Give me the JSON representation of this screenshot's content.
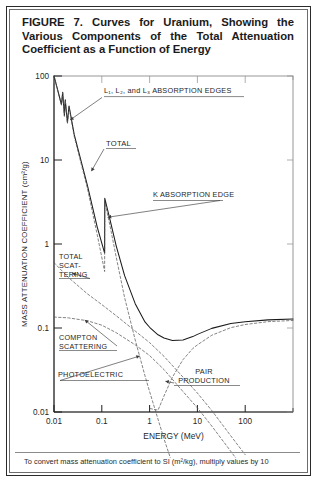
{
  "figure": {
    "caption": "FIGURE 7. Curves for Uranium, Showing the Various Components of the Total Attenuation Coefficient as a Function of Energy",
    "footnote": "To convert mass attenuation coefficient to SI (m²/kg), multiply values by 10"
  },
  "chart_data": {
    "type": "line",
    "title": "Curves for Uranium, Showing the Various Components of the Total Attenuation Coefficient as a Function of Energy",
    "xlabel": "ENERGY (MeV)",
    "ylabel": "MASS ATTENUATION COEFFICIENT (cm²/g)",
    "xscale": "log",
    "yscale": "log",
    "xlim": [
      0.01,
      1000
    ],
    "ylim": [
      0.01,
      100
    ],
    "xticks": [
      0.01,
      0.1,
      1,
      10,
      100
    ],
    "xtick_labels": [
      "0.01",
      "0.1",
      "1",
      "10",
      "100"
    ],
    "yticks": [
      0.01,
      0.1,
      1,
      10,
      100
    ],
    "ytick_labels": [
      "0.01",
      "0.1",
      "1",
      "10",
      "100"
    ],
    "grid": false,
    "legend": "none (inline annotations)",
    "series": [
      {
        "name": "TOTAL",
        "style": "solid",
        "points": [
          [
            0.01,
            100
          ],
          [
            0.0143,
            46
          ],
          [
            0.0152,
            64
          ],
          [
            0.0165,
            34
          ],
          [
            0.0172,
            52
          ],
          [
            0.0191,
            28
          ],
          [
            0.0206,
            44
          ],
          [
            0.0265,
            20
          ],
          [
            0.05,
            5.0
          ],
          [
            0.08,
            1.6
          ],
          [
            0.1146,
            0.78
          ],
          [
            0.1155,
            3.5
          ],
          [
            0.15,
            1.9
          ],
          [
            0.2,
            0.95
          ],
          [
            0.3,
            0.42
          ],
          [
            0.5,
            0.195
          ],
          [
            0.8,
            0.118
          ],
          [
            1.0,
            0.102
          ],
          [
            1.5,
            0.083
          ],
          [
            2.0,
            0.076
          ],
          [
            3.0,
            0.071
          ],
          [
            5.0,
            0.072
          ],
          [
            8.0,
            0.079
          ],
          [
            10,
            0.084
          ],
          [
            20,
            0.099
          ],
          [
            50,
            0.113
          ],
          [
            100,
            0.119
          ],
          [
            300,
            0.125
          ],
          [
            1000,
            0.128
          ]
        ]
      },
      {
        "name": "PHOTOELECTRIC",
        "style": "dashed",
        "points": [
          [
            0.01,
            100
          ],
          [
            0.0143,
            45
          ],
          [
            0.0152,
            63
          ],
          [
            0.0165,
            33
          ],
          [
            0.0172,
            51
          ],
          [
            0.0191,
            27
          ],
          [
            0.0206,
            43
          ],
          [
            0.0265,
            19
          ],
          [
            0.05,
            4.6
          ],
          [
            0.08,
            1.3
          ],
          [
            0.1146,
            0.47
          ],
          [
            0.1155,
            3.2
          ],
          [
            0.15,
            1.6
          ],
          [
            0.2,
            0.7
          ],
          [
            0.3,
            0.23
          ],
          [
            0.5,
            0.072
          ],
          [
            0.8,
            0.027
          ],
          [
            1.0,
            0.0175
          ],
          [
            1.5,
            0.0082
          ],
          [
            2.0,
            0.0048
          ],
          [
            3.0,
            0.0024
          ]
        ]
      },
      {
        "name": "TOTAL SCATTERING",
        "style": "dashed",
        "points": [
          [
            0.01,
            0.6
          ],
          [
            0.02,
            0.4
          ],
          [
            0.05,
            0.255
          ],
          [
            0.1,
            0.19
          ],
          [
            0.2,
            0.14
          ],
          [
            0.5,
            0.092
          ],
          [
            1.0,
            0.067
          ],
          [
            2.0,
            0.046
          ],
          [
            5.0,
            0.026
          ],
          [
            10,
            0.0168
          ],
          [
            20,
            0.0104
          ],
          [
            50,
            0.0052
          ],
          [
            100,
            0.0031
          ]
        ]
      },
      {
        "name": "COMPTON SCATTERING",
        "style": "dashed",
        "points": [
          [
            0.01,
            0.135
          ],
          [
            0.02,
            0.132
          ],
          [
            0.05,
            0.122
          ],
          [
            0.1,
            0.108
          ],
          [
            0.2,
            0.088
          ],
          [
            0.5,
            0.063
          ],
          [
            1.0,
            0.047
          ],
          [
            2.0,
            0.032
          ],
          [
            5.0,
            0.0175
          ],
          [
            10,
            0.0112
          ],
          [
            20,
            0.0068
          ],
          [
            50,
            0.0034
          ],
          [
            100,
            0.002
          ]
        ]
      },
      {
        "name": "PAIR PRODUCTION",
        "style": "dashed",
        "points": [
          [
            1.022,
            0.011
          ],
          [
            1.5,
            0.0105
          ],
          [
            2.0,
            0.0155
          ],
          [
            3.0,
            0.026
          ],
          [
            5.0,
            0.042
          ],
          [
            8.0,
            0.057
          ],
          [
            10,
            0.063
          ],
          [
            20,
            0.082
          ],
          [
            50,
            0.101
          ],
          [
            100,
            0.11
          ],
          [
            300,
            0.119
          ],
          [
            1000,
            0.123
          ]
        ]
      }
    ],
    "annotations": [
      {
        "id": "l-edges",
        "text": "L₁, L₂, and L₃ ABSORPTION EDGES",
        "target_x": 0.018,
        "target_y": 30
      },
      {
        "id": "total",
        "text": "TOTAL",
        "target_x": 0.055,
        "target_y": 8.0
      },
      {
        "id": "k-edge",
        "text": "K ABSORPTION EDGE",
        "target_x": 0.1155,
        "target_y": 2.2
      },
      {
        "id": "total-scattering",
        "text": "TOTAL SCAT-TERING",
        "target_x": 0.018,
        "target_y": 0.5
      },
      {
        "id": "compton-scattering",
        "text": "COMPTON SCATTERING",
        "target_x": 0.03,
        "target_y": 0.128
      },
      {
        "id": "photoelectric",
        "text": "PHOTOELECTRIC",
        "target_x": 0.62,
        "target_y": 0.049
      },
      {
        "id": "pair-production",
        "text": "PAIR PRODUCTION",
        "target_x": 2.6,
        "target_y": 0.022
      }
    ]
  }
}
